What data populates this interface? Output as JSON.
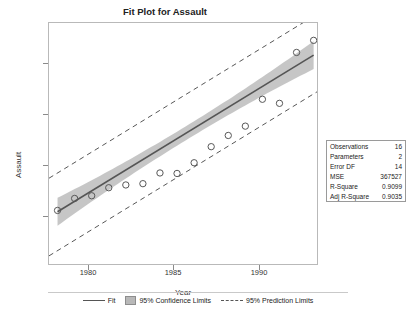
{
  "chart_data": {
    "type": "scatter",
    "title": "Fit Plot for Assault",
    "xlabel": "Year",
    "ylabel": "Assault",
    "xlim": [
      1977.5,
      1993.2
    ],
    "ylim": [
      600,
      9600
    ],
    "xticks": [
      "1980",
      "1985",
      "1990"
    ],
    "xtick_values": [
      1980,
      1985,
      1990
    ],
    "yticks": [
      "2000",
      "4000",
      "6000",
      "8000"
    ],
    "ytick_values": [
      2000,
      4000,
      6000,
      8000
    ],
    "grid": false,
    "legend_position": "bottom",
    "points": [
      {
        "x": 1978,
        "y": 2600
      },
      {
        "x": 1979,
        "y": 3050
      },
      {
        "x": 1980,
        "y": 3150
      },
      {
        "x": 1981,
        "y": 3450
      },
      {
        "x": 1982,
        "y": 3550
      },
      {
        "x": 1983,
        "y": 3600
      },
      {
        "x": 1984,
        "y": 4000
      },
      {
        "x": 1985,
        "y": 3980
      },
      {
        "x": 1986,
        "y": 4380
      },
      {
        "x": 1987,
        "y": 4980
      },
      {
        "x": 1988,
        "y": 5400
      },
      {
        "x": 1989,
        "y": 5750
      },
      {
        "x": 1990,
        "y": 6750
      },
      {
        "x": 1991,
        "y": 6600
      },
      {
        "x": 1992,
        "y": 8500
      },
      {
        "x": 1993,
        "y": 8950
      }
    ],
    "fit_line": {
      "x": [
        1978,
        1993
      ],
      "y": [
        2550,
        8400
      ]
    },
    "confidence_band": {
      "half_width_center": 260,
      "half_width_edge": 520
    },
    "prediction_band": {
      "half_width": 1450
    },
    "series": [
      {
        "name": "Fit",
        "style": "solid-line"
      },
      {
        "name": "95% Confidence Limits",
        "style": "shaded-band"
      },
      {
        "name": "95% Prediction Limits",
        "style": "dashed-line"
      }
    ]
  },
  "stats_box": {
    "rows": [
      {
        "label": "Observations",
        "value": "16"
      },
      {
        "label": "Parameters",
        "value": "2"
      },
      {
        "label": "Error DF",
        "value": "14"
      },
      {
        "label": "MSE",
        "value": "367527"
      },
      {
        "label": "R-Square",
        "value": "0.9099"
      },
      {
        "label": "Adj R-Square",
        "value": "0.9035"
      }
    ]
  },
  "legend": {
    "items": [
      {
        "label": "Fit",
        "swatch": "solid-line"
      },
      {
        "label": "95% Confidence Limits",
        "swatch": "band"
      },
      {
        "label": "95% Prediction Limits",
        "swatch": "dashed-line"
      }
    ]
  },
  "colors": {
    "fit_line": "#555555",
    "band_fill": "#b0b0b0",
    "marker_edge": "#555555",
    "frame": "#b9b9b9",
    "text": "#222222"
  }
}
